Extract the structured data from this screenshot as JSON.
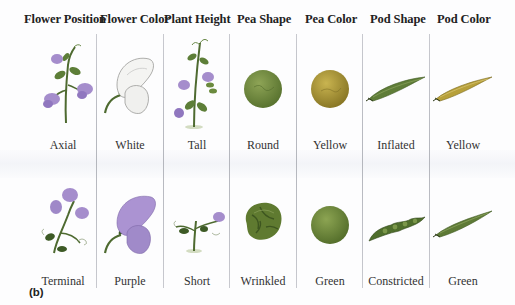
{
  "figure": {
    "panel_label": "(b)",
    "columns": [
      {
        "trait": "Flower Position",
        "dominant": "Axial",
        "recessive": "Terminal"
      },
      {
        "trait": "Flower Color",
        "dominant": "White",
        "recessive": "Purple"
      },
      {
        "trait": "Plant Height",
        "dominant": "Tall",
        "recessive": "Short"
      },
      {
        "trait": "Pea Shape",
        "dominant": "Round",
        "recessive": "Wrinkled"
      },
      {
        "trait": "Pea Color",
        "dominant": "Yellow",
        "recessive": "Green"
      },
      {
        "trait": "Pod Shape",
        "dominant": "Inflated",
        "recessive": "Constricted"
      },
      {
        "trait": "Pod Color",
        "dominant": "Yellow",
        "recessive": "Green"
      }
    ],
    "colors": {
      "flower_purple": "#a98fd0",
      "leaf_green": "#5a7a3a",
      "pea_green": "#6b8a3e",
      "pea_yellow": "#b09a3a",
      "pod_green": "#5e7a38",
      "pod_yellow": "#b9a23a",
      "divider": "#b8bac0"
    }
  }
}
